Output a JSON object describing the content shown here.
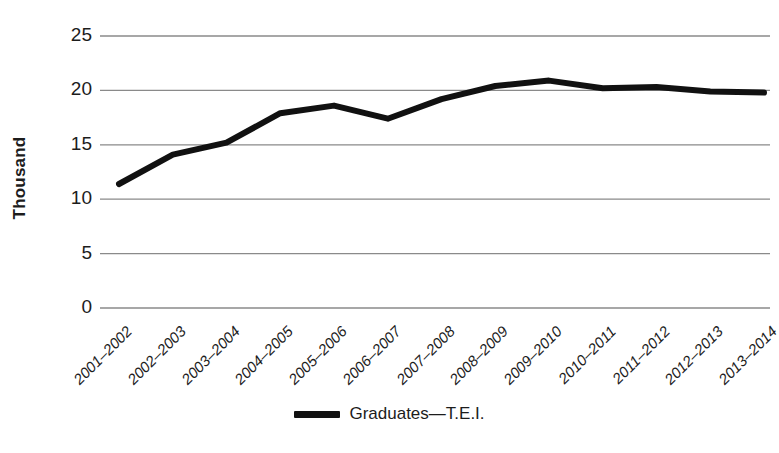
{
  "chart_data": {
    "type": "line",
    "title": "",
    "xlabel": "",
    "ylabel": "Thousand",
    "ylim": [
      0,
      25
    ],
    "yticks": [
      0,
      5,
      10,
      15,
      20,
      25
    ],
    "grid": true,
    "legend_position": "bottom",
    "categories": [
      "2001–2002",
      "2002–2003",
      "2003–2004",
      "2004–2005",
      "2005–2006",
      "2006–2007",
      "2007–2008",
      "2008–2009",
      "2009–2010",
      "2010–2011",
      "2011–2012",
      "2012–2013",
      "2013–2014"
    ],
    "series": [
      {
        "name": "Graduates—T.E.I.",
        "color": "#111111",
        "values": [
          11.4,
          14.1,
          15.2,
          17.9,
          18.6,
          17.4,
          19.2,
          20.4,
          20.9,
          20.2,
          20.3,
          19.9,
          19.8
        ]
      }
    ]
  },
  "axis": {
    "y_title": "Thousand",
    "y_tick_labels": [
      "25",
      "20",
      "15",
      "10",
      "5",
      "0"
    ]
  },
  "legend": {
    "entries": [
      {
        "label": "Graduates—T.E.I.",
        "color": "#111111"
      }
    ]
  },
  "style": {
    "line_color": "#111111",
    "gridline_color": "#8a8a8a",
    "background": "#ffffff",
    "text_color": "#1c1c1c"
  }
}
